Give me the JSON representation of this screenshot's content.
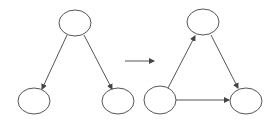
{
  "diagram": {
    "colors": {
      "stroke": "#444444",
      "background": "#ffffff"
    },
    "left_graph": {
      "nodes": [
        {
          "id": "A",
          "cx": 75,
          "cy": 23
        },
        {
          "id": "B",
          "cx": 34,
          "cy": 101
        },
        {
          "id": "C",
          "cx": 118,
          "cy": 101
        }
      ],
      "edges": [
        {
          "from": "A",
          "to": "B"
        },
        {
          "from": "A",
          "to": "C"
        }
      ]
    },
    "transform_arrow": {
      "x1": 125,
      "y1": 61,
      "x2": 154,
      "y2": 61
    },
    "right_graph": {
      "nodes": [
        {
          "id": "A",
          "cx": 203,
          "cy": 22
        },
        {
          "id": "B",
          "cx": 160,
          "cy": 101
        },
        {
          "id": "C",
          "cx": 246,
          "cy": 101
        }
      ],
      "edges": [
        {
          "from": "B",
          "to": "A"
        },
        {
          "from": "A",
          "to": "C"
        },
        {
          "from": "B",
          "to": "C"
        }
      ]
    }
  }
}
